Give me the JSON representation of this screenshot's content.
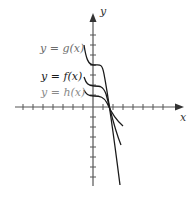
{
  "labels": {
    "g": "y = g(x)",
    "f": "y = f(x)",
    "h": "y = h(x)",
    "x_axis": "x",
    "y_axis": "y"
  },
  "colors": {
    "axis": "#555555",
    "curve": "#1a1a1a",
    "label_g": "#6b6b6b",
    "label_f": "#1a1a1a",
    "label_h": "#8a8a8a"
  },
  "axes": {
    "x_ticks_left": 8,
    "x_ticks_right": 7,
    "y_ticks_up": 6,
    "y_ticks_down": 7
  },
  "curves": [
    {
      "name": "g",
      "description": "cubic-like, plateau above f, steepest descent"
    },
    {
      "name": "f",
      "description": "cubic-like, plateau between g and h"
    },
    {
      "name": "h",
      "description": "cubic-like, lowest plateau, shallowest descent"
    }
  ]
}
